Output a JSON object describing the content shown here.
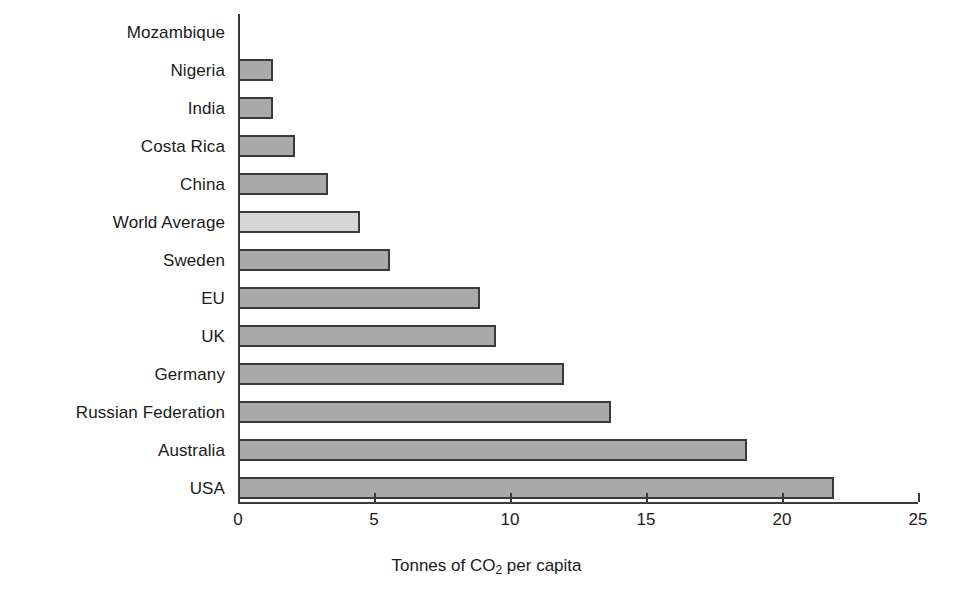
{
  "chart_data": {
    "type": "bar",
    "orientation": "horizontal",
    "title": "",
    "xlabel": "Tonnes of CO2 per capita",
    "xlabel_parts": {
      "before": "Tonnes of CO",
      "sub": "2",
      "after": " per capita"
    },
    "ylabel": "",
    "xlim": [
      0,
      25
    ],
    "xticks": [
      0,
      5,
      10,
      15,
      20,
      25
    ],
    "xtick_labels": [
      "0",
      "5",
      "10",
      "15",
      "20",
      "25"
    ],
    "grid": false,
    "legend": false,
    "categories": [
      "Mozambique",
      "Nigeria",
      "India",
      "Costa Rica",
      "China",
      "World Average",
      "Sweden",
      "EU",
      "UK",
      "Germany",
      "Russian Federation",
      "Australia",
      "USA"
    ],
    "values": [
      0,
      1.3,
      1.3,
      2.1,
      3.3,
      4.5,
      5.6,
      8.9,
      9.5,
      12.0,
      13.7,
      18.7,
      21.9
    ],
    "highlighted_category": "World Average",
    "colors": {
      "bar_fill": "#a9a9a9",
      "bar_fill_highlight": "#d6d6d6",
      "bar_border": "#3a3a3a",
      "axis": "#3a3a3a",
      "text": "#1a1a1a",
      "background": "#ffffff"
    }
  }
}
